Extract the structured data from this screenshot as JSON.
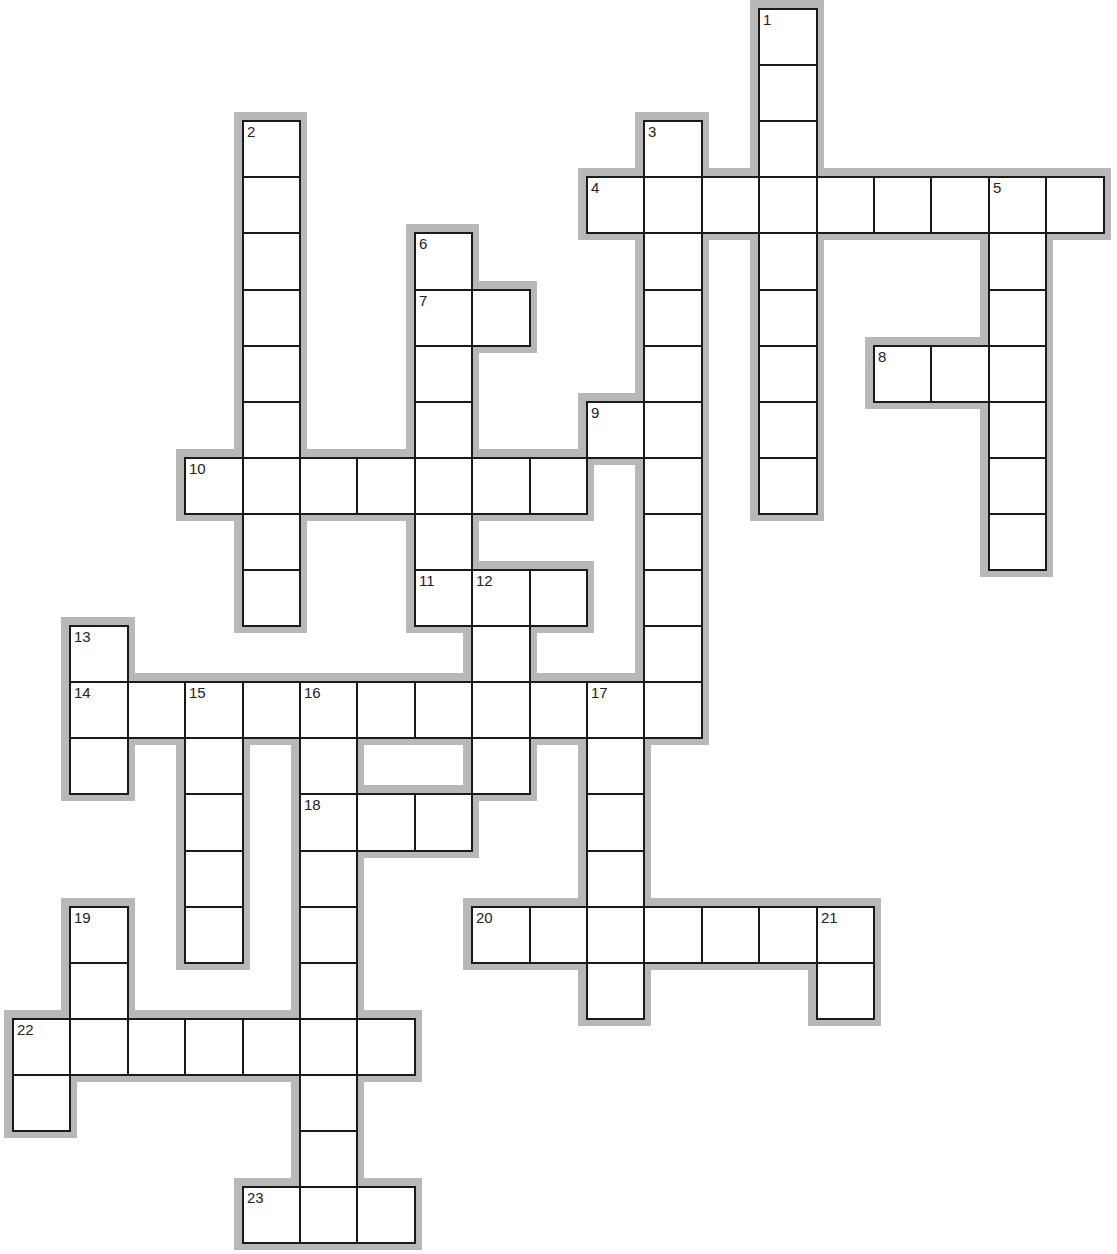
{
  "puzzle": {
    "type": "crossword",
    "grid": {
      "origin_x": 12,
      "origin_y": 8,
      "cell_w": 57.4,
      "cell_h": 56.1,
      "halo_px": 8,
      "colors": {
        "cell_bg": "#ffffff",
        "cell_border": "#1a1a1a",
        "halo": "#b8b8b8",
        "page_bg": "#ffffff"
      }
    },
    "words": [
      {
        "number": 1,
        "direction": "down",
        "row": 0,
        "col": 13,
        "length": 9
      },
      {
        "number": 2,
        "direction": "down",
        "row": 2,
        "col": 4,
        "length": 9
      },
      {
        "number": 3,
        "direction": "down",
        "row": 2,
        "col": 11,
        "length": 11
      },
      {
        "number": 4,
        "direction": "across",
        "row": 3,
        "col": 10,
        "length": 9
      },
      {
        "number": 5,
        "direction": "down",
        "row": 3,
        "col": 17,
        "length": 7
      },
      {
        "number": 6,
        "direction": "down",
        "row": 4,
        "col": 7,
        "length": 7
      },
      {
        "number": 7,
        "direction": "across",
        "row": 5,
        "col": 7,
        "length": 2
      },
      {
        "number": 8,
        "direction": "across",
        "row": 6,
        "col": 15,
        "length": 3
      },
      {
        "number": 9,
        "direction": "across",
        "row": 7,
        "col": 10,
        "length": 2
      },
      {
        "number": 10,
        "direction": "across",
        "row": 8,
        "col": 3,
        "length": 7
      },
      {
        "number": 11,
        "direction": "across",
        "row": 10,
        "col": 7,
        "length": 3
      },
      {
        "number": 12,
        "direction": "down",
        "row": 10,
        "col": 8,
        "length": 4
      },
      {
        "number": 13,
        "direction": "down",
        "row": 11,
        "col": 1,
        "length": 3
      },
      {
        "number": 14,
        "direction": "across",
        "row": 12,
        "col": 1,
        "length": 11
      },
      {
        "number": 15,
        "direction": "down",
        "row": 12,
        "col": 3,
        "length": 5
      },
      {
        "number": 16,
        "direction": "down",
        "row": 12,
        "col": 5,
        "length": 10
      },
      {
        "number": 17,
        "direction": "down",
        "row": 12,
        "col": 10,
        "length": 6
      },
      {
        "number": 18,
        "direction": "across",
        "row": 14,
        "col": 5,
        "length": 3
      },
      {
        "number": 19,
        "direction": "down",
        "row": 16,
        "col": 1,
        "length": 3
      },
      {
        "number": 20,
        "direction": "across",
        "row": 16,
        "col": 8,
        "length": 7
      },
      {
        "number": 21,
        "direction": "down",
        "row": 16,
        "col": 14,
        "length": 2
      },
      {
        "number": 22,
        "direction": "across",
        "row": 18,
        "col": 0,
        "length": 7
      },
      {
        "number": 22,
        "direction": "down",
        "row": 18,
        "col": 0,
        "length": 2
      },
      {
        "number": 23,
        "direction": "across",
        "row": 21,
        "col": 4,
        "length": 3
      }
    ],
    "clue_numbers": [
      "1",
      "2",
      "3",
      "4",
      "5",
      "6",
      "7",
      "8",
      "9",
      "10",
      "11",
      "12",
      "13",
      "14",
      "15",
      "16",
      "17",
      "18",
      "19",
      "20",
      "21",
      "22",
      "23"
    ]
  }
}
